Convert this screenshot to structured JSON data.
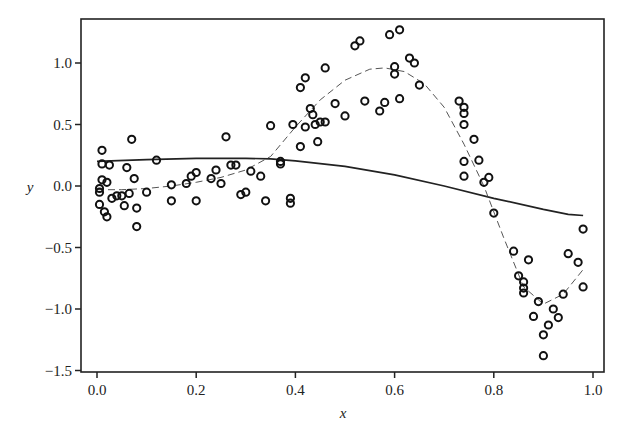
{
  "chart_data": {
    "type": "scatter",
    "title": "",
    "xlabel": "x",
    "ylabel": "y",
    "xlim": [
      -0.03,
      1.02
    ],
    "ylim": [
      -1.5,
      1.37
    ],
    "xticks": [
      0.0,
      0.2,
      0.4,
      0.6,
      0.8,
      1.0
    ],
    "xtick_labels": [
      "0.0",
      "0.2",
      "0.4",
      "0.6",
      "0.8",
      "1.0"
    ],
    "yticks": [
      1.0,
      0.5,
      0.0,
      -0.5,
      -1.0,
      -1.5
    ],
    "ytick_labels": [
      "1.0",
      "0.5",
      "0.0",
      "−0.5",
      "−1.0",
      "−1.5"
    ],
    "grid": false,
    "legend": null,
    "series": [
      {
        "name": "observations",
        "kind": "scatter",
        "marker": "open-circle",
        "points": [
          [
            0.005,
            -0.02
          ],
          [
            0.005,
            -0.05
          ],
          [
            0.005,
            -0.15
          ],
          [
            0.01,
            0.29
          ],
          [
            0.01,
            0.05
          ],
          [
            0.01,
            0.18
          ],
          [
            0.015,
            -0.21
          ],
          [
            0.02,
            0.03
          ],
          [
            0.02,
            -0.25
          ],
          [
            0.025,
            0.17
          ],
          [
            0.03,
            -0.1
          ],
          [
            0.04,
            -0.08
          ],
          [
            0.05,
            -0.08
          ],
          [
            0.055,
            -0.16
          ],
          [
            0.06,
            0.15
          ],
          [
            0.065,
            -0.06
          ],
          [
            0.07,
            0.38
          ],
          [
            0.075,
            0.06
          ],
          [
            0.08,
            -0.18
          ],
          [
            0.08,
            -0.33
          ],
          [
            0.1,
            -0.05
          ],
          [
            0.12,
            0.21
          ],
          [
            0.15,
            0.01
          ],
          [
            0.15,
            -0.12
          ],
          [
            0.18,
            0.02
          ],
          [
            0.19,
            0.08
          ],
          [
            0.2,
            0.11
          ],
          [
            0.2,
            -0.12
          ],
          [
            0.23,
            0.06
          ],
          [
            0.24,
            0.13
          ],
          [
            0.25,
            0.02
          ],
          [
            0.26,
            0.4
          ],
          [
            0.27,
            0.17
          ],
          [
            0.28,
            0.17
          ],
          [
            0.29,
            -0.07
          ],
          [
            0.3,
            -0.05
          ],
          [
            0.31,
            0.12
          ],
          [
            0.33,
            0.08
          ],
          [
            0.34,
            -0.12
          ],
          [
            0.35,
            0.49
          ],
          [
            0.37,
            0.18
          ],
          [
            0.37,
            0.2
          ],
          [
            0.39,
            -0.1
          ],
          [
            0.39,
            -0.14
          ],
          [
            0.395,
            0.5
          ],
          [
            0.41,
            0.8
          ],
          [
            0.41,
            0.32
          ],
          [
            0.42,
            0.88
          ],
          [
            0.42,
            0.48
          ],
          [
            0.43,
            0.63
          ],
          [
            0.435,
            0.58
          ],
          [
            0.44,
            0.5
          ],
          [
            0.445,
            0.36
          ],
          [
            0.45,
            0.52
          ],
          [
            0.46,
            0.96
          ],
          [
            0.46,
            0.52
          ],
          [
            0.48,
            0.67
          ],
          [
            0.5,
            0.57
          ],
          [
            0.52,
            1.14
          ],
          [
            0.53,
            1.18
          ],
          [
            0.54,
            0.69
          ],
          [
            0.57,
            0.61
          ],
          [
            0.58,
            0.68
          ],
          [
            0.59,
            1.23
          ],
          [
            0.6,
            0.97
          ],
          [
            0.6,
            0.91
          ],
          [
            0.61,
            1.27
          ],
          [
            0.61,
            0.71
          ],
          [
            0.63,
            1.04
          ],
          [
            0.64,
            1.0
          ],
          [
            0.65,
            0.82
          ],
          [
            0.73,
            0.69
          ],
          [
            0.74,
            0.64
          ],
          [
            0.74,
            0.59
          ],
          [
            0.74,
            0.5
          ],
          [
            0.74,
            0.2
          ],
          [
            0.74,
            0.08
          ],
          [
            0.76,
            0.38
          ],
          [
            0.77,
            0.21
          ],
          [
            0.78,
            0.03
          ],
          [
            0.79,
            0.07
          ],
          [
            0.8,
            -0.22
          ],
          [
            0.84,
            -0.53
          ],
          [
            0.85,
            -0.73
          ],
          [
            0.86,
            -0.78
          ],
          [
            0.86,
            -0.83
          ],
          [
            0.86,
            -0.87
          ],
          [
            0.87,
            -0.6
          ],
          [
            0.88,
            -1.06
          ],
          [
            0.89,
            -0.94
          ],
          [
            0.9,
            -1.21
          ],
          [
            0.9,
            -1.38
          ],
          [
            0.91,
            -1.13
          ],
          [
            0.92,
            -1.0
          ],
          [
            0.93,
            -1.07
          ],
          [
            0.94,
            -0.88
          ],
          [
            0.95,
            -0.55
          ],
          [
            0.97,
            -0.62
          ],
          [
            0.98,
            -0.82
          ],
          [
            0.98,
            -0.35
          ]
        ]
      },
      {
        "name": "fit-solid",
        "kind": "line",
        "style": "solid",
        "x": [
          0.0,
          0.1,
          0.2,
          0.3,
          0.35,
          0.4,
          0.5,
          0.6,
          0.7,
          0.8,
          0.9,
          0.95,
          0.98
        ],
        "y": [
          0.2,
          0.215,
          0.225,
          0.225,
          0.22,
          0.205,
          0.16,
          0.09,
          0.0,
          -0.1,
          -0.19,
          -0.23,
          -0.24
        ]
      },
      {
        "name": "fit-dashed",
        "kind": "line",
        "style": "dashed",
        "x": [
          0.0,
          0.05,
          0.1,
          0.15,
          0.2,
          0.25,
          0.3,
          0.35,
          0.4,
          0.45,
          0.5,
          0.55,
          0.58,
          0.62,
          0.66,
          0.7,
          0.74,
          0.78,
          0.82,
          0.86,
          0.9,
          0.94,
          0.98
        ],
        "y": [
          -0.03,
          -0.03,
          -0.02,
          0.0,
          0.03,
          0.07,
          0.13,
          0.24,
          0.48,
          0.7,
          0.86,
          0.95,
          0.96,
          0.93,
          0.83,
          0.64,
          0.34,
          0.0,
          -0.42,
          -0.82,
          -0.96,
          -0.88,
          -0.68
        ]
      }
    ]
  },
  "axes": {
    "xlabel": "x",
    "ylabel": "y"
  }
}
